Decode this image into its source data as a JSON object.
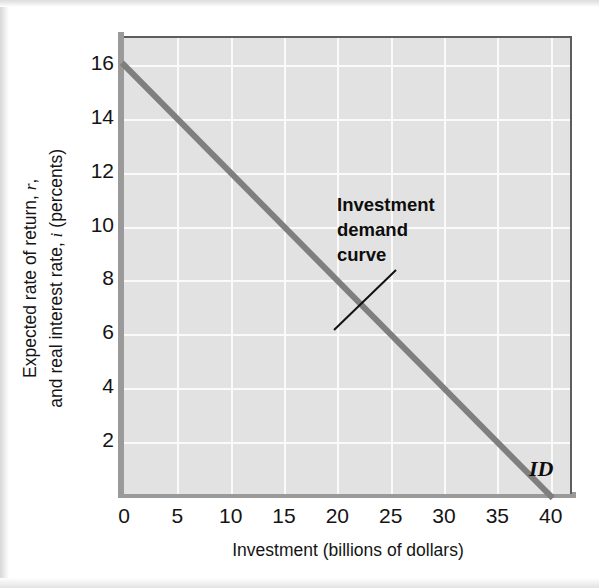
{
  "chart_data": {
    "type": "line",
    "title": "",
    "xlabel": "Investment (billions of dollars)",
    "ylabel_line1": "Expected rate of return, r,",
    "ylabel_line2": "and real interest rate, i (percents)",
    "xlim": [
      0,
      42
    ],
    "ylim": [
      0,
      17
    ],
    "xticks": [
      "0",
      "5",
      "10",
      "15",
      "20",
      "25",
      "30",
      "35",
      "40"
    ],
    "xtick_values": [
      0,
      5,
      10,
      15,
      20,
      25,
      30,
      35,
      40
    ],
    "yticks": [
      "2",
      "4",
      "6",
      "8",
      "10",
      "12",
      "14",
      "16"
    ],
    "ytick_values": [
      2,
      4,
      6,
      8,
      10,
      12,
      14,
      16
    ],
    "grid": true,
    "grid_color": "#fafafa",
    "plot_background": "#e2e2e2",
    "legend_position": "none",
    "series": [
      {
        "name": "ID",
        "label": "ID",
        "color": "#807f80",
        "linewidth": 6,
        "x": [
          0,
          40
        ],
        "values": [
          16,
          0
        ],
        "points": [
          {
            "x": 0,
            "y": 16
          },
          {
            "x": 5,
            "y": 14
          },
          {
            "x": 10,
            "y": 12
          },
          {
            "x": 15,
            "y": 10
          },
          {
            "x": 20,
            "y": 8
          },
          {
            "x": 25,
            "y": 6
          },
          {
            "x": 30,
            "y": 4
          },
          {
            "x": 35,
            "y": 2
          },
          {
            "x": 40,
            "y": 0
          }
        ]
      }
    ],
    "annotations": [
      {
        "text_lines": [
          "Investment",
          "demand",
          "curve"
        ],
        "full_text": "Investment demand curve",
        "points_to": {
          "x": 23.5,
          "y": 7
        }
      },
      {
        "text": "ID",
        "at": {
          "x": 41,
          "y": 1
        }
      }
    ]
  },
  "axis": {
    "x_title": "Investment (billions of dollars)",
    "y_title_line1": "Expected rate of return, r,",
    "y_title_line2": "and real interest rate, i (percents)",
    "y_title_var1": "r",
    "y_title_var2": "i",
    "y_title_part1a": "Expected rate of return, ",
    "y_title_part1b": ",",
    "y_title_part2a": "and real interest rate, ",
    "y_title_part2b": " (percents)"
  },
  "annotation": {
    "line1": "Investment",
    "line2": "demand",
    "line3": "curve"
  },
  "curve_label": {
    "text": "ID"
  },
  "colors": {
    "curve": "#807f80",
    "axis": "#9a9a9a",
    "plot_bg": "#e2e2e2",
    "grid": "#fafafa",
    "text": "#141414",
    "page_bg": "#ffffff"
  }
}
